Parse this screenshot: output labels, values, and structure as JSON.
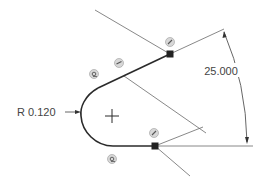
{
  "sketch": {
    "colors": {
      "background": "#ffffff",
      "profile": "#2a2a2a",
      "construction": "#6a6a6a",
      "dimension": "#555555",
      "text": "#444444",
      "endpoint": "#222222",
      "glyph_fill": "#d8d8d8",
      "glyph_stroke": "#7a7a7a"
    },
    "dimensions": {
      "angle": {
        "label": "25.000",
        "unit": "deg"
      },
      "radius": {
        "label": "R 0.120"
      }
    },
    "constraints": [
      {
        "type": "coincident",
        "icon": "coincident-icon",
        "location": "top-endpoint"
      },
      {
        "type": "coincident",
        "icon": "coincident-icon",
        "location": "upper-line-midpoint"
      },
      {
        "type": "tangent",
        "icon": "tangent-icon",
        "location": "arc-top"
      },
      {
        "type": "coincident",
        "icon": "coincident-icon",
        "location": "bottom-endpoint"
      },
      {
        "type": "tangent",
        "icon": "tangent-icon",
        "location": "arc-bottom"
      }
    ],
    "center_mark": "arc-center-cross"
  }
}
